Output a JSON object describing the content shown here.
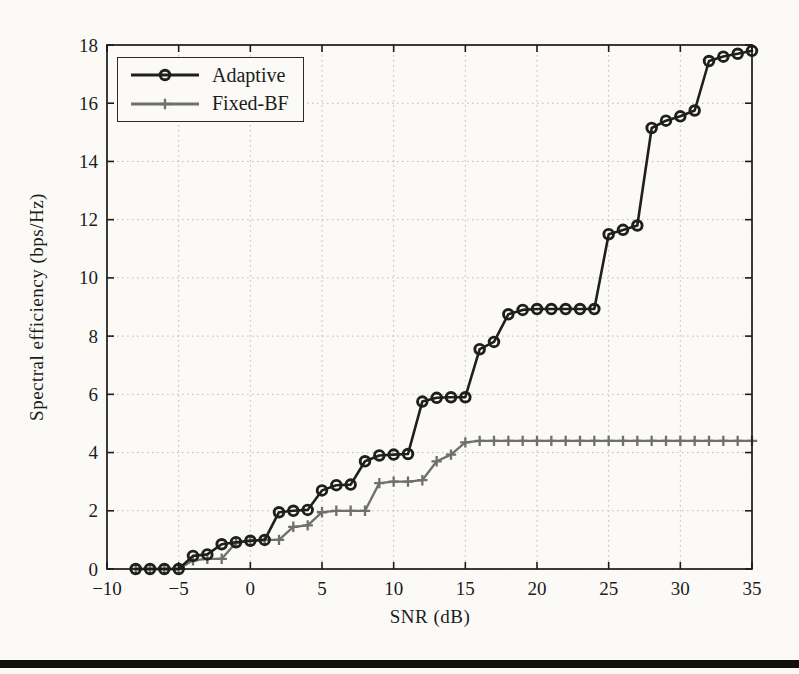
{
  "page": {
    "background": "#fbfaf7",
    "bottom_rule_color": "#101010"
  },
  "chart_data": {
    "type": "line",
    "title": "",
    "xlabel": "SNR (dB)",
    "ylabel": "Spectral efficiency (bps/Hz)",
    "xlim": [
      -10,
      35
    ],
    "ylim": [
      0,
      18
    ],
    "x_ticks": [
      -10,
      -5,
      0,
      5,
      10,
      15,
      20,
      25,
      30,
      35
    ],
    "x_tick_labels": [
      "−10",
      "−5",
      "0",
      "5",
      "10",
      "15",
      "20",
      "25",
      "30",
      "35"
    ],
    "y_ticks": [
      0,
      2,
      4,
      6,
      8,
      10,
      12,
      14,
      16,
      18
    ],
    "y_tick_labels": [
      "0",
      "2",
      "4",
      "6",
      "8",
      "10",
      "12",
      "14",
      "16",
      "18"
    ],
    "grid": "dotted",
    "grid_color": "#bdbdbd",
    "axes_color": "#1b1b1b",
    "text_color": "#1c1c1c",
    "legend_position": "top-left",
    "series": [
      {
        "name": "Adaptive",
        "color": "#1f1f1f",
        "marker": "circle",
        "line_width": 2.6,
        "points": [
          [
            -8,
            0
          ],
          [
            -7,
            0
          ],
          [
            -6,
            0
          ],
          [
            -5,
            0
          ],
          [
            -4,
            0.45
          ],
          [
            -3,
            0.5
          ],
          [
            -2,
            0.85
          ],
          [
            -1,
            0.92
          ],
          [
            0,
            0.97
          ],
          [
            1,
            1.0
          ],
          [
            2,
            1.95
          ],
          [
            3,
            2.0
          ],
          [
            4,
            2.03
          ],
          [
            5,
            2.7
          ],
          [
            6,
            2.88
          ],
          [
            7,
            2.9
          ],
          [
            8,
            3.7
          ],
          [
            9,
            3.9
          ],
          [
            10,
            3.93
          ],
          [
            11,
            3.95
          ],
          [
            12,
            5.75
          ],
          [
            13,
            5.88
          ],
          [
            14,
            5.9
          ],
          [
            15,
            5.9
          ],
          [
            16,
            7.55
          ],
          [
            17,
            7.8
          ],
          [
            18,
            8.75
          ],
          [
            19,
            8.9
          ],
          [
            20,
            8.93
          ],
          [
            21,
            8.93
          ],
          [
            22,
            8.93
          ],
          [
            23,
            8.93
          ],
          [
            24,
            8.93
          ],
          [
            25,
            11.5
          ],
          [
            26,
            11.65
          ],
          [
            27,
            11.8
          ],
          [
            28,
            15.15
          ],
          [
            29,
            15.4
          ],
          [
            30,
            15.55
          ],
          [
            31,
            15.75
          ],
          [
            32,
            17.45
          ],
          [
            33,
            17.6
          ],
          [
            34,
            17.7
          ],
          [
            35,
            17.8
          ]
        ]
      },
      {
        "name": "Fixed-BF",
        "color": "#6f6f6f",
        "marker": "plus",
        "line_width": 2.3,
        "points": [
          [
            -8,
            0
          ],
          [
            -7,
            0
          ],
          [
            -6,
            0
          ],
          [
            -5,
            0
          ],
          [
            -4,
            0.3
          ],
          [
            -3,
            0.35
          ],
          [
            -2,
            0.35
          ],
          [
            -1,
            0.9
          ],
          [
            0,
            0.97
          ],
          [
            1,
            1.0
          ],
          [
            2,
            1.0
          ],
          [
            3,
            1.45
          ],
          [
            4,
            1.5
          ],
          [
            5,
            1.95
          ],
          [
            6,
            2.0
          ],
          [
            7,
            2.0
          ],
          [
            8,
            2.0
          ],
          [
            9,
            2.95
          ],
          [
            10,
            3.0
          ],
          [
            11,
            3.0
          ],
          [
            12,
            3.05
          ],
          [
            13,
            3.7
          ],
          [
            14,
            3.93
          ],
          [
            15,
            4.35
          ],
          [
            16,
            4.4
          ],
          [
            17,
            4.4
          ],
          [
            18,
            4.4
          ],
          [
            19,
            4.4
          ],
          [
            20,
            4.4
          ],
          [
            21,
            4.4
          ],
          [
            22,
            4.4
          ],
          [
            23,
            4.4
          ],
          [
            24,
            4.4
          ],
          [
            25,
            4.4
          ],
          [
            26,
            4.4
          ],
          [
            27,
            4.4
          ],
          [
            28,
            4.4
          ],
          [
            29,
            4.4
          ],
          [
            30,
            4.4
          ],
          [
            31,
            4.4
          ],
          [
            32,
            4.4
          ],
          [
            33,
            4.4
          ],
          [
            34,
            4.4
          ],
          [
            35,
            4.4
          ]
        ]
      }
    ]
  }
}
